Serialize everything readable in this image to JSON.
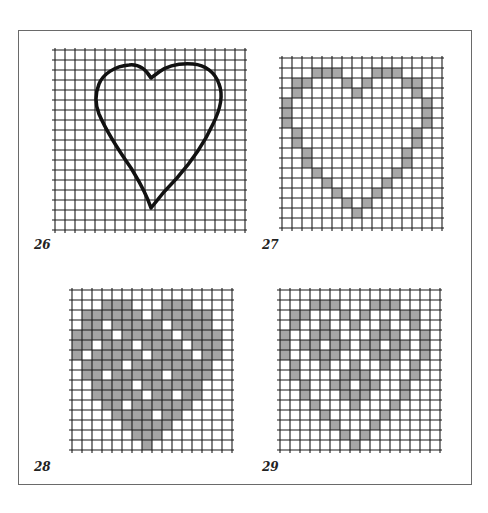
{
  "figure": {
    "panels": [
      {
        "id": "26",
        "label": "26",
        "type": "outline",
        "grid": {
          "x": 55,
          "y": 50,
          "cols": 19,
          "rows": 18,
          "cell": 10
        },
        "outline_path": "M 96 28 C 90 18, 82 14, 74 15 C 60 16, 48 24, 44 34 C 40 44, 40 54, 44 64 C 50 78, 62 98, 76 118 C 82 128, 90 140, 96 158 C 102 150, 110 140, 122 128 C 136 112, 148 96, 158 74 C 166 58, 168 44, 164 34 C 160 22, 150 15, 138 14 C 124 13, 112 16, 104 22 Z",
        "stroke_color": "#111111",
        "label_pos": {
          "x": 34,
          "y": 240
        }
      },
      {
        "id": "27",
        "label": "27",
        "type": "cells",
        "grid": {
          "x": 282,
          "y": 58,
          "cols": 16,
          "rows": 17,
          "cell": 10
        },
        "fill_color": "#a8a8a8",
        "cells": [
          [
            3,
            1
          ],
          [
            4,
            1
          ],
          [
            5,
            1
          ],
          [
            9,
            1
          ],
          [
            10,
            1
          ],
          [
            11,
            1
          ],
          [
            1,
            2
          ],
          [
            2,
            2
          ],
          [
            6,
            2
          ],
          [
            8,
            2
          ],
          [
            12,
            2
          ],
          [
            13,
            2
          ],
          [
            1,
            3
          ],
          [
            7,
            3
          ],
          [
            13,
            3
          ],
          [
            0,
            4
          ],
          [
            14,
            4
          ],
          [
            0,
            5
          ],
          [
            14,
            5
          ],
          [
            0,
            6
          ],
          [
            14,
            6
          ],
          [
            1,
            7
          ],
          [
            13,
            7
          ],
          [
            1,
            8
          ],
          [
            13,
            8
          ],
          [
            2,
            9
          ],
          [
            12,
            9
          ],
          [
            2,
            10
          ],
          [
            12,
            10
          ],
          [
            3,
            11
          ],
          [
            11,
            11
          ],
          [
            4,
            12
          ],
          [
            10,
            12
          ],
          [
            5,
            13
          ],
          [
            9,
            13
          ],
          [
            6,
            14
          ],
          [
            8,
            14
          ],
          [
            7,
            15
          ]
        ],
        "label_pos": {
          "x": 262,
          "y": 240
        }
      },
      {
        "id": "28",
        "label": "28",
        "type": "cells",
        "grid": {
          "x": 72,
          "y": 290,
          "cols": 16,
          "rows": 16,
          "cell": 10
        },
        "fill_color": "#a4a4a4",
        "cells": [
          [
            3,
            1
          ],
          [
            4,
            1
          ],
          [
            5,
            1
          ],
          [
            9,
            1
          ],
          [
            10,
            1
          ],
          [
            11,
            1
          ],
          [
            1,
            2
          ],
          [
            2,
            2
          ],
          [
            3,
            2
          ],
          [
            4,
            2
          ],
          [
            5,
            2
          ],
          [
            6,
            2
          ],
          [
            8,
            2
          ],
          [
            9,
            2
          ],
          [
            10,
            2
          ],
          [
            11,
            2
          ],
          [
            12,
            2
          ],
          [
            13,
            2
          ],
          [
            1,
            3
          ],
          [
            2,
            3
          ],
          [
            4,
            3
          ],
          [
            5,
            3
          ],
          [
            6,
            3
          ],
          [
            7,
            3
          ],
          [
            8,
            3
          ],
          [
            10,
            3
          ],
          [
            11,
            3
          ],
          [
            12,
            3
          ],
          [
            13,
            3
          ],
          [
            0,
            4
          ],
          [
            1,
            4
          ],
          [
            2,
            4
          ],
          [
            3,
            4
          ],
          [
            5,
            4
          ],
          [
            6,
            4
          ],
          [
            7,
            4
          ],
          [
            8,
            4
          ],
          [
            9,
            4
          ],
          [
            11,
            4
          ],
          [
            12,
            4
          ],
          [
            13,
            4
          ],
          [
            14,
            4
          ],
          [
            0,
            5
          ],
          [
            1,
            5
          ],
          [
            3,
            5
          ],
          [
            4,
            5
          ],
          [
            5,
            5
          ],
          [
            7,
            5
          ],
          [
            8,
            5
          ],
          [
            9,
            5
          ],
          [
            10,
            5
          ],
          [
            12,
            5
          ],
          [
            13,
            5
          ],
          [
            14,
            5
          ],
          [
            0,
            6
          ],
          [
            2,
            6
          ],
          [
            3,
            6
          ],
          [
            4,
            6
          ],
          [
            5,
            6
          ],
          [
            6,
            6
          ],
          [
            8,
            6
          ],
          [
            9,
            6
          ],
          [
            10,
            6
          ],
          [
            11,
            6
          ],
          [
            13,
            6
          ],
          [
            14,
            6
          ],
          [
            1,
            7
          ],
          [
            2,
            7
          ],
          [
            3,
            7
          ],
          [
            4,
            7
          ],
          [
            6,
            7
          ],
          [
            7,
            7
          ],
          [
            8,
            7
          ],
          [
            9,
            7
          ],
          [
            10,
            7
          ],
          [
            11,
            7
          ],
          [
            12,
            7
          ],
          [
            13,
            7
          ],
          [
            1,
            8
          ],
          [
            2,
            8
          ],
          [
            4,
            8
          ],
          [
            5,
            8
          ],
          [
            6,
            8
          ],
          [
            7,
            8
          ],
          [
            8,
            8
          ],
          [
            10,
            8
          ],
          [
            11,
            8
          ],
          [
            12,
            8
          ],
          [
            13,
            8
          ],
          [
            2,
            9
          ],
          [
            3,
            9
          ],
          [
            4,
            9
          ],
          [
            5,
            9
          ],
          [
            7,
            9
          ],
          [
            8,
            9
          ],
          [
            9,
            9
          ],
          [
            10,
            9
          ],
          [
            11,
            9
          ],
          [
            12,
            9
          ],
          [
            2,
            10
          ],
          [
            3,
            10
          ],
          [
            4,
            10
          ],
          [
            5,
            10
          ],
          [
            6,
            10
          ],
          [
            8,
            10
          ],
          [
            9,
            10
          ],
          [
            11,
            10
          ],
          [
            12,
            10
          ],
          [
            3,
            11
          ],
          [
            4,
            11
          ],
          [
            6,
            11
          ],
          [
            7,
            11
          ],
          [
            8,
            11
          ],
          [
            9,
            11
          ],
          [
            10,
            11
          ],
          [
            11,
            11
          ],
          [
            4,
            12
          ],
          [
            5,
            12
          ],
          [
            6,
            12
          ],
          [
            7,
            12
          ],
          [
            9,
            12
          ],
          [
            10,
            12
          ],
          [
            5,
            13
          ],
          [
            6,
            13
          ],
          [
            7,
            13
          ],
          [
            8,
            13
          ],
          [
            9,
            13
          ],
          [
            6,
            14
          ],
          [
            7,
            14
          ],
          [
            8,
            14
          ],
          [
            7,
            15
          ]
        ],
        "label_pos": {
          "x": 34,
          "y": 462
        }
      },
      {
        "id": "29",
        "label": "29",
        "type": "cells",
        "grid": {
          "x": 280,
          "y": 290,
          "cols": 16,
          "rows": 16,
          "cell": 10
        },
        "fill_color": "#a6a6a6",
        "cells": [
          [
            3,
            1
          ],
          [
            4,
            1
          ],
          [
            5,
            1
          ],
          [
            9,
            1
          ],
          [
            10,
            1
          ],
          [
            11,
            1
          ],
          [
            1,
            2
          ],
          [
            2,
            2
          ],
          [
            6,
            2
          ],
          [
            8,
            2
          ],
          [
            12,
            2
          ],
          [
            13,
            2
          ],
          [
            1,
            3
          ],
          [
            4,
            3
          ],
          [
            7,
            3
          ],
          [
            10,
            3
          ],
          [
            13,
            3
          ],
          [
            0,
            4
          ],
          [
            3,
            4
          ],
          [
            4,
            4
          ],
          [
            5,
            4
          ],
          [
            9,
            4
          ],
          [
            10,
            4
          ],
          [
            11,
            4
          ],
          [
            14,
            4
          ],
          [
            0,
            5
          ],
          [
            2,
            5
          ],
          [
            3,
            5
          ],
          [
            5,
            5
          ],
          [
            6,
            5
          ],
          [
            8,
            5
          ],
          [
            9,
            5
          ],
          [
            11,
            5
          ],
          [
            12,
            5
          ],
          [
            14,
            5
          ],
          [
            0,
            6
          ],
          [
            3,
            6
          ],
          [
            4,
            6
          ],
          [
            5,
            6
          ],
          [
            9,
            6
          ],
          [
            10,
            6
          ],
          [
            11,
            6
          ],
          [
            14,
            6
          ],
          [
            1,
            7
          ],
          [
            4,
            7
          ],
          [
            7,
            7
          ],
          [
            10,
            7
          ],
          [
            13,
            7
          ],
          [
            1,
            8
          ],
          [
            6,
            8
          ],
          [
            7,
            8
          ],
          [
            8,
            8
          ],
          [
            13,
            8
          ],
          [
            2,
            9
          ],
          [
            5,
            9
          ],
          [
            6,
            9
          ],
          [
            8,
            9
          ],
          [
            9,
            9
          ],
          [
            12,
            9
          ],
          [
            2,
            10
          ],
          [
            6,
            10
          ],
          [
            7,
            10
          ],
          [
            8,
            10
          ],
          [
            12,
            10
          ],
          [
            3,
            11
          ],
          [
            7,
            11
          ],
          [
            11,
            11
          ],
          [
            4,
            12
          ],
          [
            10,
            12
          ],
          [
            5,
            13
          ],
          [
            9,
            13
          ],
          [
            6,
            14
          ],
          [
            8,
            14
          ],
          [
            7,
            15
          ]
        ],
        "label_pos": {
          "x": 262,
          "y": 462
        }
      }
    ]
  }
}
